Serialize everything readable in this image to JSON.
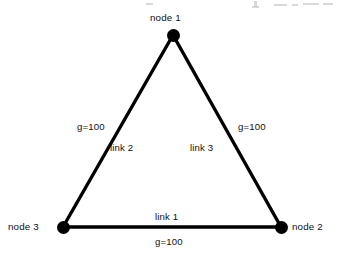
{
  "figure": {
    "type": "network-diagram",
    "background_color": "#ffffff",
    "stroke_color": "#000000",
    "text_color": "#111111",
    "width": 341,
    "height": 269
  },
  "nodes": [
    {
      "id": "node1",
      "label": "node 1",
      "x": 173,
      "y": 35,
      "label_position": "above"
    },
    {
      "id": "node2",
      "label": "node 2",
      "x": 281,
      "y": 227,
      "label_position": "right"
    },
    {
      "id": "node3",
      "label": "node 3",
      "x": 63,
      "y": 227,
      "label_position": "left"
    }
  ],
  "links": [
    {
      "id": "link1",
      "label": "link 1",
      "weight_label": "g=100",
      "from": "node3",
      "to": "node2",
      "label_position": "above",
      "weight_position": "below"
    },
    {
      "id": "link2",
      "label": "link 2",
      "weight_label": "g=100",
      "from": "node3",
      "to": "node1",
      "label_position": "inner-right",
      "weight_position": "outer-left"
    },
    {
      "id": "link3",
      "label": "link 3",
      "weight_label": "g=100",
      "from": "node1",
      "to": "node2",
      "label_position": "inner-left",
      "weight_position": "outer-right"
    }
  ],
  "artifacts": {
    "description": "faint scan remnants of cut-off text along top edge",
    "marks": [
      {
        "x": 146,
        "y": 3,
        "w": 7,
        "h": 2
      },
      {
        "x": 254,
        "y": 1,
        "w": 3,
        "h": 6
      },
      {
        "x": 252,
        "y": 6,
        "w": 7,
        "h": 2
      },
      {
        "x": 274,
        "y": 4,
        "w": 13,
        "h": 2
      },
      {
        "x": 292,
        "y": 4,
        "w": 6,
        "h": 2
      },
      {
        "x": 303,
        "y": 3,
        "w": 16,
        "h": 2
      },
      {
        "x": 323,
        "y": 3,
        "w": 10,
        "h": 2
      }
    ]
  }
}
